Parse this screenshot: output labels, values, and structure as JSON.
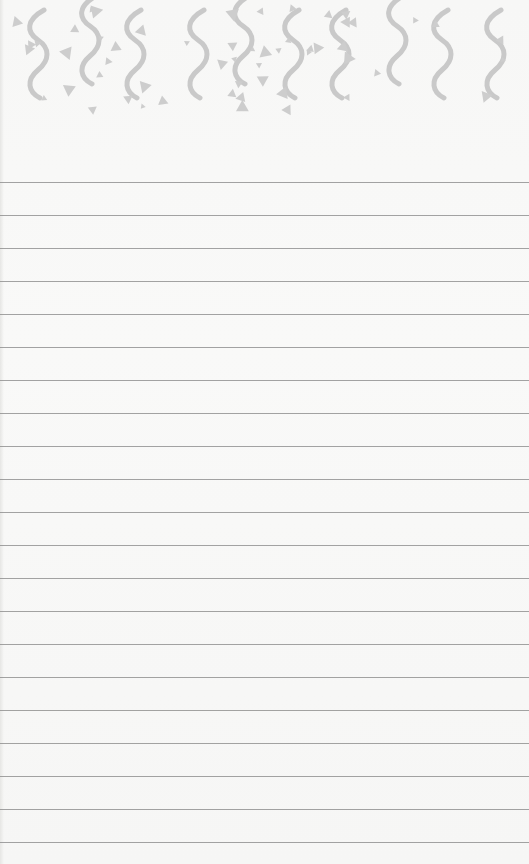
{
  "page": {
    "type": "lined-notepad",
    "background_color": "#f7f7f6",
    "decoration_color": "#c8c8c8",
    "line_color": "#8c8c8c"
  },
  "header": {
    "pattern": "confetti-squiggles-and-triangles",
    "squiggle_x": [
      38,
      90,
      135,
      198,
      243,
      293,
      340,
      397,
      442,
      495
    ]
  },
  "rules": {
    "first_y": 182,
    "spacing": 33,
    "count": 21
  }
}
